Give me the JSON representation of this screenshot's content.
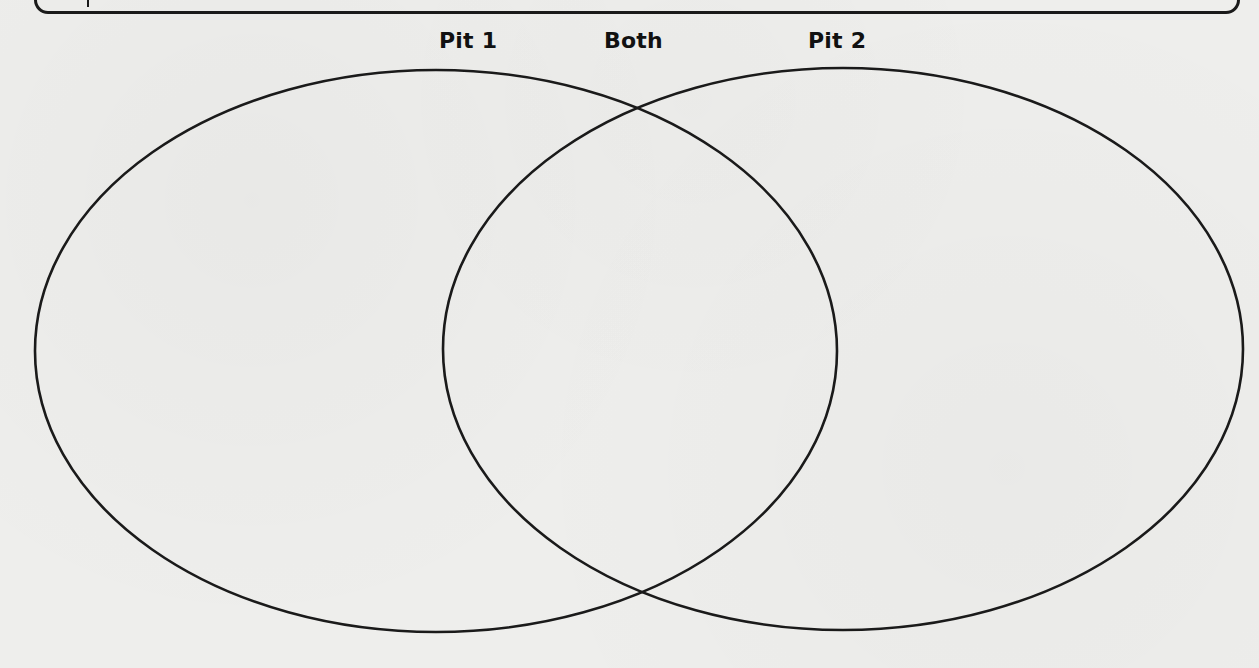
{
  "diagram": {
    "type": "venn",
    "labels": {
      "left": "Pit 1",
      "center": "Both",
      "right": "Pit 2"
    },
    "circles": [
      {
        "name": "Pit 1",
        "cx": 436,
        "cy": 351,
        "rx": 401,
        "ry": 281
      },
      {
        "name": "Pit 2",
        "cx": 843,
        "cy": 349,
        "rx": 400,
        "ry": 281
      }
    ],
    "regions": {
      "pit1_only": [],
      "both": [],
      "pit2_only": []
    },
    "stroke_color": "#1a1a1a",
    "background_color": "#eeeeec"
  }
}
